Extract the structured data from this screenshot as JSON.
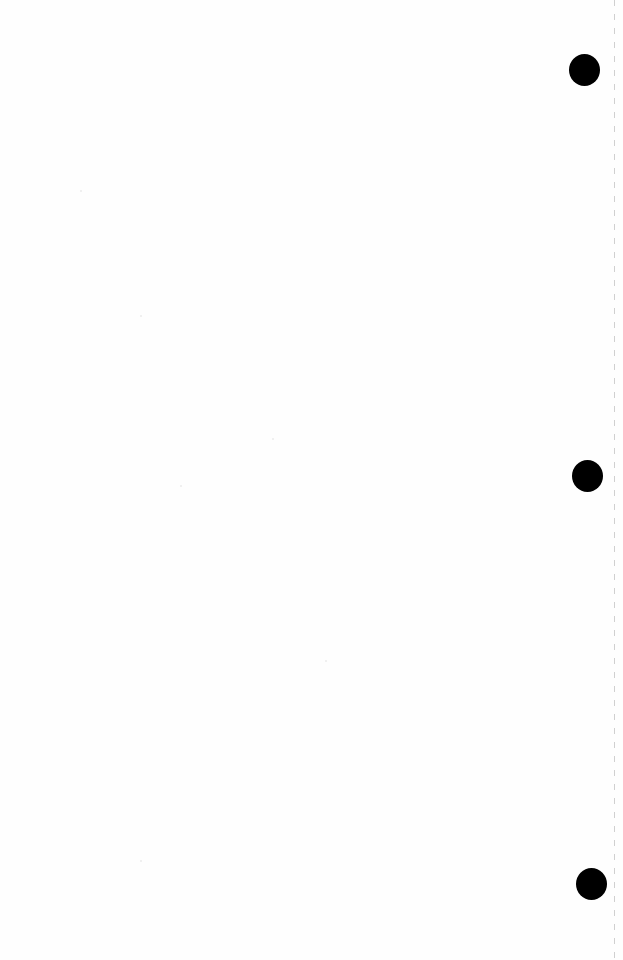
{
  "document": {
    "description": "Blank scanned page",
    "content_text": "",
    "punch_holes": [
      {
        "cx": 584,
        "cy": 70,
        "r": 15
      },
      {
        "cx": 587,
        "cy": 476,
        "r": 15
      },
      {
        "cx": 591,
        "cy": 884,
        "r": 15
      }
    ],
    "colors": {
      "paper": "#fefefe",
      "hole": "#000000",
      "edge_line": "#aaaaaa"
    }
  }
}
